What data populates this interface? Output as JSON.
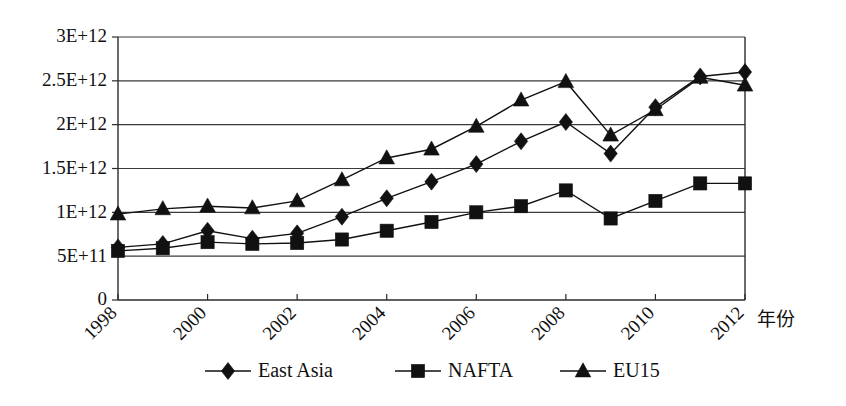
{
  "chart_data": {
    "type": "line",
    "title": "",
    "subtitle": "",
    "xlabel": "年份",
    "ylabel": "",
    "x": [
      1998,
      1999,
      2000,
      2001,
      2002,
      2003,
      2004,
      2005,
      2006,
      2007,
      2008,
      2009,
      2010,
      2011,
      2012
    ],
    "categories": [
      "1998",
      "1999",
      "2000",
      "2001",
      "2002",
      "2003",
      "2004",
      "2005",
      "2006",
      "2007",
      "2008",
      "2009",
      "2010",
      "2011",
      "2012"
    ],
    "xlim": [
      1998,
      2012
    ],
    "ylim": [
      0,
      3000000000000
    ],
    "grid": true,
    "legend_position": "bottom",
    "y_tick_values": [
      0,
      500000000000,
      1000000000000,
      1500000000000,
      2000000000000,
      2500000000000,
      3000000000000
    ],
    "y_tick_labels": [
      "0",
      "5E+11",
      "1E+12",
      "1.5E+12",
      "2E+12",
      "2.5E+12",
      "3E+12"
    ],
    "x_tick_values": [
      1998,
      1999,
      2000,
      2001,
      2002,
      2003,
      2004,
      2005,
      2006,
      2007,
      2008,
      2009,
      2010,
      2011,
      2012
    ],
    "x_tick_labels": [
      "1998",
      "",
      "2000",
      "",
      "2002",
      "",
      "2004",
      "",
      "2006",
      "",
      "2008",
      "",
      "2010",
      "",
      "2012"
    ],
    "x_major_ticks": [
      1998,
      2000,
      2002,
      2004,
      2006,
      2008,
      2010,
      2012
    ],
    "series": [
      {
        "name": "East Asia",
        "marker": "diamond",
        "color": "#111111",
        "values": [
          600000000000,
          640000000000,
          790000000000,
          700000000000,
          760000000000,
          950000000000,
          1160000000000,
          1350000000000,
          1550000000000,
          1810000000000,
          2030000000000,
          1670000000000,
          2200000000000,
          2550000000000,
          2600000000000
        ]
      },
      {
        "name": "NAFTA",
        "marker": "square",
        "color": "#111111",
        "values": [
          560000000000,
          590000000000,
          660000000000,
          640000000000,
          650000000000,
          690000000000,
          790000000000,
          890000000000,
          1000000000000,
          1070000000000,
          1250000000000,
          930000000000,
          1130000000000,
          1330000000000,
          1330000000000
        ]
      },
      {
        "name": "EU15",
        "marker": "triangle",
        "color": "#111111",
        "values": [
          980000000000,
          1040000000000,
          1070000000000,
          1050000000000,
          1130000000000,
          1370000000000,
          1620000000000,
          1720000000000,
          1980000000000,
          2280000000000,
          2490000000000,
          1880000000000,
          2170000000000,
          2540000000000,
          2450000000000
        ]
      }
    ]
  },
  "legend": {
    "items": [
      {
        "label": "East Asia",
        "marker": "diamond"
      },
      {
        "label": "NAFTA",
        "marker": "square"
      },
      {
        "label": "EU15",
        "marker": "triangle"
      }
    ]
  }
}
